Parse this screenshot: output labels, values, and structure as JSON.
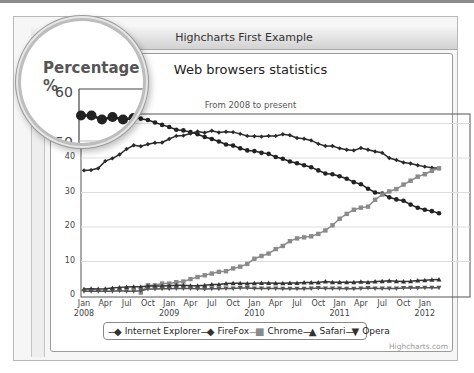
{
  "window": {
    "title": "Highcharts First Example"
  },
  "magnifier": {
    "label": "Percentage %",
    "ticks": [
      "60",
      "50"
    ]
  },
  "chart": {
    "title": "Web browsers statistics",
    "subtitle": "From 2008 to present",
    "credits": "Highcharts.com",
    "y_ticks": [
      "0",
      "10",
      "20",
      "30",
      "40"
    ],
    "x_ticks": [
      {
        "label": "Jan",
        "year": "2008"
      },
      {
        "label": "Apr",
        "year": ""
      },
      {
        "label": "Jul",
        "year": ""
      },
      {
        "label": "Oct",
        "year": ""
      },
      {
        "label": "Jan",
        "year": "2009"
      },
      {
        "label": "Apr",
        "year": ""
      },
      {
        "label": "Jul",
        "year": ""
      },
      {
        "label": "Oct",
        "year": ""
      },
      {
        "label": "Jan",
        "year": "2010"
      },
      {
        "label": "Apr",
        "year": ""
      },
      {
        "label": "Jul",
        "year": ""
      },
      {
        "label": "Oct",
        "year": ""
      },
      {
        "label": "Jan",
        "year": "2011"
      },
      {
        "label": "Apr",
        "year": ""
      },
      {
        "label": "Jul",
        "year": ""
      },
      {
        "label": "Oct",
        "year": ""
      },
      {
        "label": "Jan",
        "year": "2012"
      }
    ],
    "legend": [
      {
        "name": "Internet Explorer",
        "symbol": "◆"
      },
      {
        "name": "FireFox",
        "symbol": "◆"
      },
      {
        "name": "Chrome",
        "symbol": "■"
      },
      {
        "name": "Safari",
        "symbol": "▲"
      },
      {
        "name": "Opera",
        "symbol": "▼"
      }
    ]
  },
  "chart_data": {
    "type": "line",
    "title": "Web browsers statistics",
    "subtitle": "From 2008 to present",
    "xlabel": "",
    "ylabel": "Percentage %",
    "ylim": [
      0,
      60
    ],
    "grid": true,
    "legend_position": "bottom",
    "x": [
      "2008-01",
      "2008-02",
      "2008-03",
      "2008-04",
      "2008-05",
      "2008-06",
      "2008-07",
      "2008-08",
      "2008-09",
      "2008-10",
      "2008-11",
      "2008-12",
      "2009-01",
      "2009-02",
      "2009-03",
      "2009-04",
      "2009-05",
      "2009-06",
      "2009-07",
      "2009-08",
      "2009-09",
      "2009-10",
      "2009-11",
      "2009-12",
      "2010-01",
      "2010-02",
      "2010-03",
      "2010-04",
      "2010-05",
      "2010-06",
      "2010-07",
      "2010-08",
      "2010-09",
      "2010-10",
      "2010-11",
      "2010-12",
      "2011-01",
      "2011-02",
      "2011-03",
      "2011-04",
      "2011-05",
      "2011-06",
      "2011-07",
      "2011-08",
      "2011-09",
      "2011-10",
      "2011-11",
      "2011-12",
      "2012-01",
      "2012-02",
      "2012-03"
    ],
    "series": [
      {
        "name": "Internet Explorer",
        "marker": "circle",
        "values": [
          54.7,
          54.7,
          53.9,
          54.4,
          53.9,
          54.2,
          53.1,
          52.0,
          51.4,
          51.0,
          50.3,
          49.6,
          49.0,
          48.2,
          48.0,
          47.5,
          46.9,
          46.1,
          45.5,
          44.8,
          43.9,
          43.6,
          42.8,
          42.2,
          42.0,
          41.5,
          41.2,
          40.3,
          39.8,
          39.0,
          38.5,
          37.9,
          37.3,
          36.4,
          35.5,
          35.3,
          34.7,
          34.0,
          33.0,
          32.4,
          31.1,
          30.0,
          29.7,
          28.6,
          28.0,
          27.6,
          26.5,
          25.6,
          25.0,
          24.6,
          24.0
        ]
      },
      {
        "name": "FireFox",
        "marker": "diamond",
        "values": [
          36.4,
          36.5,
          37.0,
          39.1,
          39.9,
          41.0,
          42.6,
          43.7,
          43.4,
          44.0,
          44.4,
          44.5,
          45.5,
          46.4,
          46.5,
          47.1,
          47.7,
          47.3,
          47.9,
          47.4,
          47.6,
          47.5,
          47.0,
          46.4,
          46.3,
          46.2,
          46.4,
          46.4,
          46.9,
          46.6,
          45.8,
          45.6,
          45.1,
          44.1,
          43.5,
          43.5,
          42.8,
          42.4,
          42.2,
          42.9,
          42.4,
          41.9,
          41.5,
          40.0,
          39.4,
          38.7,
          38.4,
          37.9,
          37.5,
          37.2,
          37.0
        ]
      },
      {
        "name": "Chrome",
        "marker": "square",
        "values": [
          0.0,
          0.0,
          0.0,
          0.0,
          0.0,
          0.0,
          0.0,
          0.0,
          1.0,
          3.1,
          3.1,
          3.6,
          3.6,
          4.0,
          4.2,
          4.9,
          5.5,
          6.0,
          6.5,
          7.0,
          7.2,
          8.0,
          8.5,
          9.3,
          10.8,
          11.6,
          12.3,
          13.6,
          14.5,
          15.9,
          16.7,
          17.0,
          17.3,
          18.0,
          19.0,
          20.5,
          22.4,
          23.8,
          25.0,
          25.6,
          25.9,
          27.9,
          29.4,
          30.3,
          31.0,
          32.3,
          33.4,
          34.6,
          35.3,
          36.3,
          37.0
        ]
      },
      {
        "name": "Safari",
        "marker": "triangle",
        "values": [
          2.0,
          2.1,
          2.0,
          2.1,
          2.3,
          2.5,
          2.6,
          2.7,
          2.7,
          2.9,
          2.9,
          2.9,
          3.0,
          3.1,
          3.1,
          3.0,
          3.0,
          3.1,
          3.3,
          3.3,
          3.6,
          3.7,
          3.7,
          3.6,
          3.7,
          3.8,
          3.8,
          3.7,
          3.7,
          3.8,
          3.8,
          3.9,
          3.9,
          3.9,
          4.2,
          4.0,
          4.0,
          4.0,
          4.0,
          4.1,
          4.0,
          4.2,
          4.3,
          4.4,
          4.3,
          4.2,
          4.3,
          4.5,
          4.6,
          4.7,
          4.8
        ]
      },
      {
        "name": "Opera",
        "marker": "triangle-down",
        "values": [
          1.4,
          1.4,
          1.4,
          1.4,
          1.4,
          1.5,
          1.4,
          1.4,
          1.5,
          2.0,
          2.0,
          2.1,
          2.1,
          2.2,
          2.2,
          2.2,
          2.1,
          2.0,
          2.1,
          2.1,
          2.2,
          2.2,
          2.3,
          2.3,
          2.2,
          2.2,
          2.2,
          2.2,
          2.1,
          2.1,
          2.1,
          2.1,
          2.2,
          2.3,
          2.2,
          2.2,
          2.2,
          2.1,
          2.1,
          2.2,
          2.3,
          2.2,
          2.2,
          2.2,
          2.2,
          2.3,
          2.4,
          2.3,
          2.4,
          2.4,
          2.4
        ]
      }
    ]
  }
}
